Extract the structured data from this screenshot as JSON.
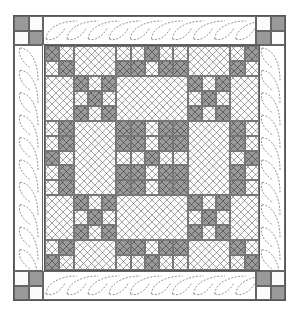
{
  "figure": {
    "type": "quilt-pattern-diagram",
    "colors": {
      "dark": "#9a9a9a",
      "light": "#fbfbfb",
      "line": "#666666"
    },
    "grid": {
      "rows": 15,
      "cols": 15,
      "legend": {
        "D": "dark square",
        "L": "light square",
        "B": "large light crosshatched block"
      },
      "cells": [
        "DLBBBLLDLLBBBLD",
        "LDBBBDDLDDBBBDL",
        "BBDLDBBBBBDLDBB",
        "BBLDLBBBBBLDLBB",
        "BBDLDBBBBBDLDBB",
        "LDBBBDDLDDBBBDL",
        "LDBBBDDLDDBBBDL",
        "DLBBBLLDLLBBBLD",
        "LDBBBDDLDDBBBDL",
        "LDBBBDDLDDBBBDL",
        "BBDLDBBBBBDLDBB",
        "BBLDLBBBBBLDLBB",
        "BBDLDBBBBBDLDBB",
        "LDBBBDDLDDBBBDL",
        "DLBBBLLDLLBBBLD"
      ]
    },
    "corners": {
      "top_left": [
        "DL",
        "LD"
      ],
      "top_right": [
        "LD",
        "DL"
      ],
      "bottom_left": [
        "LD",
        "DL"
      ],
      "bottom_right": [
        "DL",
        "LD"
      ]
    },
    "border": {
      "quilting": "dashed cable/feather motif",
      "sides": [
        "top",
        "bottom",
        "left",
        "right"
      ]
    }
  }
}
